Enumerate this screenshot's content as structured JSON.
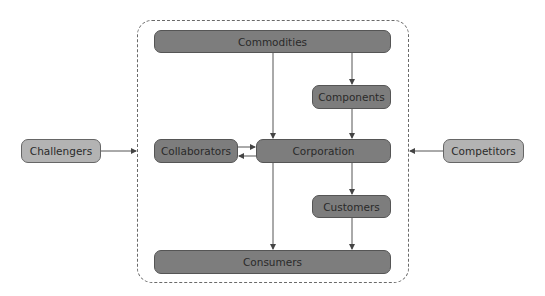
{
  "diagram": {
    "container": {
      "style": "dashed-rounded"
    },
    "nodes": {
      "commodities": {
        "label": "Commodities"
      },
      "components": {
        "label": "Components"
      },
      "collaborators": {
        "label": "Collaborators"
      },
      "corporation": {
        "label": "Corporation"
      },
      "customers": {
        "label": "Customers"
      },
      "consumers": {
        "label": "Consumers"
      },
      "challengers": {
        "label": "Challengers"
      },
      "competitors": {
        "label": "Competitors"
      }
    },
    "edges": [
      {
        "from": "Commodities",
        "to": "Corporation"
      },
      {
        "from": "Commodities",
        "to": "Components"
      },
      {
        "from": "Components",
        "to": "Corporation"
      },
      {
        "from": "Collaborators",
        "to": "Corporation"
      },
      {
        "from": "Corporation",
        "to": "Collaborators"
      },
      {
        "from": "Corporation",
        "to": "Customers"
      },
      {
        "from": "Corporation",
        "to": "Consumers"
      },
      {
        "from": "Customers",
        "to": "Consumers"
      },
      {
        "from": "Challengers",
        "to": "Container"
      },
      {
        "from": "Competitors",
        "to": "Container"
      }
    ],
    "colors": {
      "inner_node": "#7d7d7d",
      "outer_node": "#b3b3b3",
      "line": "#555555"
    }
  }
}
